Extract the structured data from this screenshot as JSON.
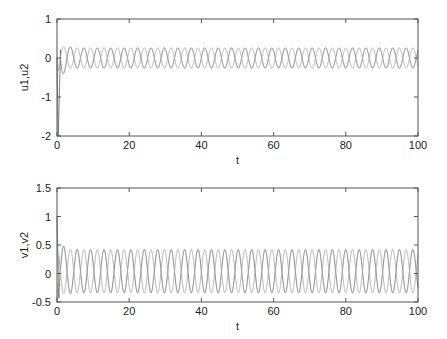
{
  "figure": {
    "background": "#ffffff",
    "width": 447,
    "height": 339
  },
  "chart_data": [
    {
      "type": "line",
      "id": "top",
      "title": "",
      "xlabel": "t",
      "ylabel": "u1,u2",
      "xlim": [
        0,
        100
      ],
      "ylim": [
        -2,
        1
      ],
      "xticks": [
        0,
        20,
        40,
        60,
        80,
        100
      ],
      "xtick_labels": [
        "0",
        "20",
        "40",
        "60",
        "80",
        "100"
      ],
      "yticks": [
        -2,
        -1,
        0,
        1
      ],
      "ytick_labels": [
        "-2",
        "-1",
        "0",
        "1"
      ],
      "grid": false,
      "legend": "none",
      "box": true,
      "series": [
        {
          "name": "u1",
          "color": "#6e6e6e",
          "description": "Starts near 0, dips sharply to -2 at t~0.3, rises rapidly overshooting to 0.5 at t~2, then settles into steady sinusoidal oscillation of amplitude 0.26 about 0 with period 3.72",
          "transient": {
            "t_start": 0,
            "t_end": 4,
            "min": -2.0,
            "max": 0.5
          },
          "steady": {
            "mean": 0.0,
            "amplitude": 0.26,
            "period": 3.72,
            "phase_deg": 90
          }
        },
        {
          "name": "u2",
          "color": "#a8a8a8",
          "description": "Starts near 0 with small dip, rises and settles into steady sinusoidal oscillation of amplitude 0.26 about 0 with period 3.72, in antiphase with u1",
          "transient": {
            "t_start": 0,
            "t_end": 4,
            "min": -0.35,
            "max": 0.12
          },
          "steady": {
            "mean": 0.0,
            "amplitude": 0.26,
            "period": 3.72,
            "phase_deg": 270
          }
        }
      ]
    },
    {
      "type": "line",
      "id": "bottom",
      "title": "",
      "xlabel": "t",
      "ylabel": "v1,v2",
      "xlim": [
        0,
        100
      ],
      "ylim": [
        -0.5,
        1.5
      ],
      "xticks": [
        0,
        20,
        40,
        60,
        80,
        100
      ],
      "xtick_labels": [
        "0",
        "20",
        "40",
        "60",
        "80",
        "100"
      ],
      "yticks": [
        -0.5,
        0,
        0.5,
        1,
        1.5
      ],
      "ytick_labels": [
        "-0.5",
        "0",
        "0.5",
        "1",
        "1.5"
      ],
      "grid": false,
      "legend": "none",
      "box": true,
      "series": [
        {
          "name": "v1",
          "color": "#6e6e6e",
          "description": "Starts at about 1.0, drops steeply to -0.5 near t~0.6, then settles into steady sinusoidal oscillation of amplitude 0.38 about 0.04 with period 3.72",
          "transient": {
            "t_start": 0,
            "t_end": 3,
            "min": -0.5,
            "max": 1.0
          },
          "steady": {
            "mean": 0.04,
            "amplitude": 0.38,
            "period": 3.72,
            "phase_deg": 270
          }
        },
        {
          "name": "v2",
          "color": "#a8a8a8",
          "description": "Starts near -0.5, rises and settles into steady sinusoidal oscillation of amplitude 0.38 about 0.04 with period 3.72, in antiphase with v1",
          "transient": {
            "t_start": 0,
            "t_end": 3,
            "min": -0.5,
            "max": 0.1
          },
          "steady": {
            "mean": 0.04,
            "amplitude": 0.38,
            "period": 3.72,
            "phase_deg": 90
          }
        }
      ]
    }
  ]
}
